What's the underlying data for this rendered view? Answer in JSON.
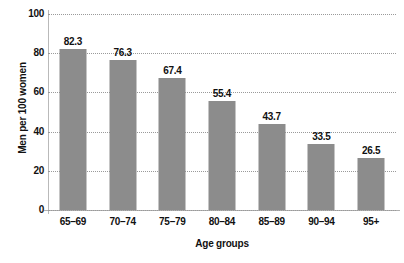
{
  "chart_data": {
    "type": "bar",
    "title": "",
    "subtitle": "",
    "xlabel": "Age groups",
    "ylabel": "Men per 100 women",
    "categories": [
      "65–69",
      "70–74",
      "75–79",
      "80–84",
      "85–89",
      "90–94",
      "95+"
    ],
    "values": [
      82.3,
      76.3,
      67.4,
      55.4,
      43.7,
      33.5,
      26.5
    ],
    "value_labels": [
      "82.3",
      "76.3",
      "67.4",
      "55.4",
      "43.7",
      "33.5",
      "26.5"
    ],
    "ylim": [
      0,
      100
    ],
    "yticks": [
      0,
      20,
      40,
      60,
      80,
      100
    ],
    "ytick_labels": [
      "0",
      "20",
      "40",
      "60",
      "80",
      "100"
    ],
    "grid": "horizontal-dotted",
    "legend": "none",
    "bar_color": "#8c8c8c",
    "axis_color": "#b0b0b0",
    "grid_color": "#9a9a9a",
    "text_color": "#111111",
    "background": "#ffffff"
  }
}
